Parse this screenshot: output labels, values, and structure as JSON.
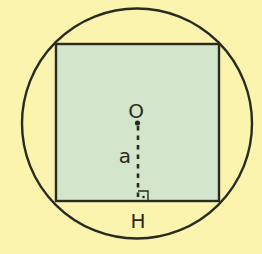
{
  "diagram": {
    "colors": {
      "background": "#fbf4ae",
      "square_fill": "#d3e6cc",
      "stroke": "#2a2a20"
    },
    "circle": {
      "cx": 137,
      "cy": 123,
      "r": 115
    },
    "square": {
      "x": 56,
      "y": 44,
      "width": 163,
      "height": 157
    },
    "labels": {
      "center": "O",
      "apothem": "a",
      "foot": "H"
    },
    "center_point": {
      "x": 138,
      "y": 123
    },
    "foot_point": {
      "x": 138,
      "y": 201
    },
    "right_angle_marker": {
      "x": 138,
      "y": 191,
      "size": 10
    }
  }
}
